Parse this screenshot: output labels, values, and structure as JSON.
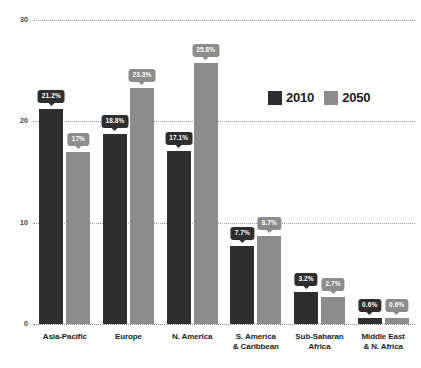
{
  "chart_data": {
    "type": "bar",
    "title": "",
    "subtitle": "",
    "xlabel": "",
    "ylabel": "",
    "ylim": [
      0,
      30
    ],
    "yticks": [
      "0",
      "10",
      "20",
      "30"
    ],
    "grid": true,
    "legend_position": "inside-upper-right",
    "categories": [
      "Asia-Pacific",
      "Europe",
      "N. America",
      "S. America\n& Caribbean",
      "Sub-Saharan\nAfrica",
      "Middle East\n& N. Africa"
    ],
    "series": [
      {
        "name": "2010",
        "color": "#2e2e2e",
        "values": [
          21.2,
          18.8,
          17.1,
          7.7,
          3.2,
          0.6
        ],
        "labels": [
          "21.2%",
          "18.8%",
          "17.1%",
          "7.7%",
          "3.2%",
          "0.6%"
        ]
      },
      {
        "name": "2050",
        "color": "#8c8c8c",
        "values": [
          17.0,
          23.3,
          25.8,
          8.7,
          2.7,
          0.6
        ],
        "labels": [
          "17%",
          "23.3%",
          "25.8%",
          "8.7%",
          "2.7%",
          "0.6%"
        ]
      }
    ]
  },
  "legend": {
    "items": [
      {
        "label": "2010",
        "color": "#2e2e2e"
      },
      {
        "label": "2050",
        "color": "#8c8c8c"
      }
    ]
  },
  "axis": {
    "y": {
      "ticks": [
        {
          "label": "30",
          "value": 30
        },
        {
          "label": "20",
          "value": 20
        },
        {
          "label": "10",
          "value": 10
        },
        {
          "label": "0",
          "value": 0
        }
      ]
    }
  }
}
